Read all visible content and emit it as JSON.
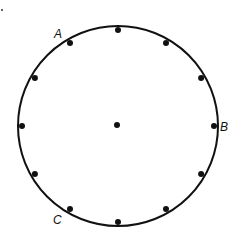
{
  "diagram": {
    "type": "clock-face-circle",
    "circle": {
      "cx": 118,
      "cy": 126,
      "r": 100,
      "stroke": "#111111",
      "stroke_width": 2
    },
    "center_dot": {
      "cx": 117,
      "cy": 125,
      "r": 3
    },
    "dot_count": 12,
    "dot_radius": 3,
    "dot_color": "#111111",
    "labels": [
      {
        "text": "A",
        "x": 54,
        "y": 38,
        "position": "11 o'clock"
      },
      {
        "text": "B",
        "x": 220,
        "y": 131,
        "position": "3 o'clock"
      },
      {
        "text": "C",
        "x": 53,
        "y": 224,
        "position": "7 o'clock"
      }
    ],
    "corner_mark": {
      "x": 2,
      "y": 10
    }
  }
}
